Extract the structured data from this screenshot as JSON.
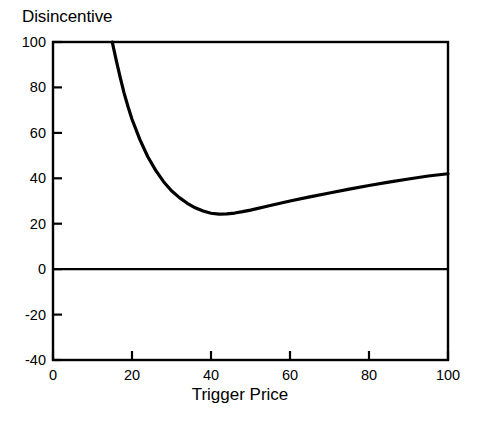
{
  "figure": {
    "title": "Disincentive",
    "xlabel": "Trigger Price"
  },
  "chart_data": {
    "type": "line",
    "title": "Disincentive",
    "xlabel": "Trigger Price",
    "ylabel": "Disincentive",
    "xlim": [
      0,
      100
    ],
    "ylim": [
      -40,
      100
    ],
    "grid": false,
    "legend": "none",
    "xticks": [
      0,
      20,
      40,
      60,
      80,
      100
    ],
    "yticks": [
      -40,
      -20,
      0,
      20,
      40,
      60,
      80,
      100
    ],
    "xticklabels": [
      "0",
      "20",
      "40",
      "60",
      "80",
      "100"
    ],
    "yticklabels": [
      "-40",
      "-20",
      "0",
      "20",
      "40",
      "60",
      "80",
      "100"
    ],
    "series": [
      {
        "name": "Disincentive curve",
        "style": "solid-thick-black",
        "color": "#000000",
        "x": [
          15,
          16,
          17,
          18,
          19,
          20,
          22,
          24,
          26,
          28,
          30,
          32,
          34,
          36,
          38,
          40,
          42,
          44,
          46,
          48,
          50,
          55,
          60,
          65,
          70,
          75,
          80,
          85,
          90,
          95,
          100
        ],
        "y": [
          100,
          92,
          84.5,
          77.5,
          71.5,
          66,
          57,
          49.5,
          43.5,
          38.5,
          34.5,
          31.5,
          29,
          27,
          25.6,
          24.6,
          24.2,
          24.3,
          24.7,
          25.3,
          26,
          28,
          30,
          31.8,
          33.5,
          35.2,
          36.8,
          38.3,
          39.7,
          41,
          42
        ]
      },
      {
        "name": "Zero reference line",
        "style": "solid-thin-black",
        "color": "#000000",
        "x": [
          0,
          100
        ],
        "y": [
          0,
          0
        ]
      }
    ],
    "annotations": [
      {
        "text": "minimum of curve",
        "x": 42,
        "y": 24.2
      },
      {
        "text": "curve enters top of frame",
        "x": 15,
        "y": 100
      },
      {
        "text": "curve exits right of frame",
        "x": 100,
        "y": 42
      }
    ]
  },
  "colors": {
    "axis": "#000000",
    "curve": "#000000",
    "background": "#ffffff"
  }
}
